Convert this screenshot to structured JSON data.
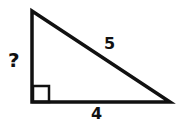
{
  "diagram": {
    "type": "right-triangle",
    "labels": {
      "vertical_leg": "?",
      "hypotenuse": "5",
      "horizontal_leg": "4"
    },
    "colors": {
      "stroke": "#111111",
      "background": "#ffffff"
    }
  }
}
